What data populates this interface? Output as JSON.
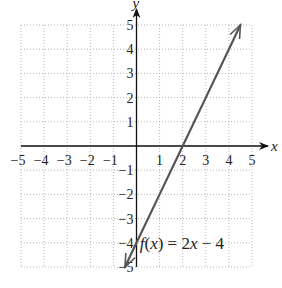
{
  "chart_data": {
    "type": "line",
    "title": "",
    "xlabel": "x",
    "ylabel": "y",
    "xlim": [
      -5,
      5
    ],
    "ylim": [
      -5,
      5
    ],
    "grid": true,
    "x_ticks": [
      -5,
      -4,
      -3,
      -2,
      -1,
      1,
      2,
      3,
      4,
      5
    ],
    "y_ticks": [
      -5,
      -4,
      -3,
      -2,
      -1,
      1,
      2,
      3,
      4,
      5
    ],
    "x_tick_labels": [
      "−5",
      "−4",
      "−3",
      "−2",
      "−1",
      "1",
      "2",
      "3",
      "4",
      "5"
    ],
    "y_tick_labels": [
      "−5",
      "−4",
      "−3",
      "−2",
      "−1",
      "1",
      "2",
      "3",
      "4",
      "5"
    ],
    "series": [
      {
        "name": "f(x) = 2x − 4",
        "function": "2x - 4",
        "x": [
          -0.5,
          0,
          1,
          2,
          3,
          4,
          4.5
        ],
        "y": [
          -5,
          -4,
          -2,
          0,
          2,
          4,
          5
        ],
        "arrows": "both",
        "color": "#555555"
      }
    ],
    "annotations": [
      {
        "text_parts": [
          "f",
          "(",
          "x",
          ") = 2",
          "x",
          " − 4"
        ],
        "text": "f(x) = 2x − 4",
        "x": 0.4,
        "y": -4
      }
    ]
  },
  "labels": {
    "x_axis": "x",
    "y_axis": "y",
    "equation_f": "f",
    "equation_x": "x",
    "equation_mid": ") = 2",
    "equation_open": "(",
    "equation_tail": " − 4"
  },
  "colors": {
    "axis": "#111111",
    "grid": "#b8b8b8",
    "line": "#555555"
  }
}
